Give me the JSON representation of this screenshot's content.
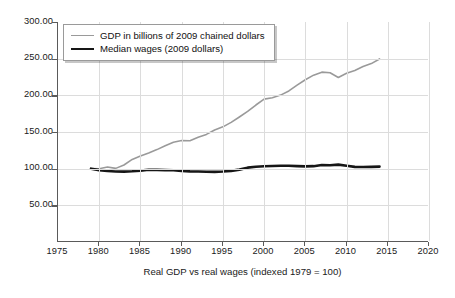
{
  "chart_data": {
    "type": "line",
    "title": "",
    "xlabel": "Real GDP vs real wages (indexed 1979 = 100)",
    "ylabel": "",
    "xlim": [
      1975,
      2020
    ],
    "ylim": [
      0,
      300
    ],
    "grid": true,
    "legend_position": "top-left",
    "x_ticks": [
      "1975",
      "1980",
      "1985",
      "1990",
      "1995",
      "2000",
      "2005",
      "2010",
      "2015",
      "2020"
    ],
    "y_ticks": [
      "50.00",
      "100.00",
      "150.00",
      "200.00",
      "250.00",
      "300.00"
    ],
    "colors": {
      "gdp": "#9a9a9a",
      "wages": "#161616",
      "axis": "#5a5a5a",
      "grid": "#dcdcdc"
    },
    "x": [
      1979,
      1980,
      1981,
      1982,
      1983,
      1984,
      1985,
      1986,
      1987,
      1988,
      1989,
      1990,
      1991,
      1992,
      1993,
      1994,
      1995,
      1996,
      1997,
      1998,
      1999,
      2000,
      2001,
      2002,
      2003,
      2004,
      2005,
      2006,
      2007,
      2008,
      2009,
      2010,
      2011,
      2012,
      2013,
      2014
    ],
    "series": [
      {
        "name": "GDP in billions of 2009 chained dollars",
        "color": "#9a9a9a",
        "width": 1.6,
        "values": [
          100.0,
          99.8,
          102.3,
          100.4,
          105.0,
          112.6,
          117.2,
          121.4,
          126.0,
          131.3,
          136.1,
          138.3,
          138.0,
          142.8,
          146.7,
          152.8,
          157.0,
          163.1,
          170.5,
          178.1,
          186.8,
          194.8,
          196.8,
          200.3,
          206.0,
          213.9,
          221.3,
          227.5,
          231.6,
          230.8,
          224.4,
          230.1,
          233.8,
          239.2,
          243.3,
          249.6
        ]
      },
      {
        "name": "Median wages (2009 dollars)",
        "color": "#161616",
        "width": 2.6,
        "values": [
          100.0,
          98.0,
          96.8,
          96.2,
          96.0,
          96.5,
          97.3,
          98.6,
          98.4,
          98.0,
          97.8,
          96.9,
          96.3,
          96.1,
          95.8,
          95.6,
          96.1,
          97.0,
          98.7,
          101.4,
          102.7,
          103.2,
          103.6,
          103.9,
          104.0,
          103.5,
          103.1,
          103.4,
          104.9,
          104.6,
          105.5,
          104.0,
          102.4,
          102.2,
          102.4,
          102.8
        ]
      }
    ]
  },
  "legend": {
    "items": [
      {
        "label": "GDP in billions of 2009 chained dollars"
      },
      {
        "label": "Median wages (2009 dollars)"
      }
    ]
  }
}
